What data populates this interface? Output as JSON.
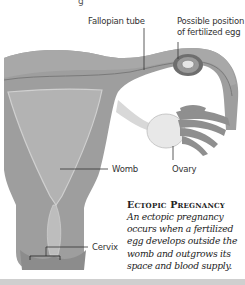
{
  "diagram": {
    "title_fragment": "g",
    "labels": {
      "fallopian_tube": "Fallopian tube",
      "possible_position_line1": "Possible position",
      "possible_position_line2": "of fertilized egg",
      "womb": "Womb",
      "ovary": "Ovary",
      "cervix": "Cervix"
    },
    "caption": {
      "title": "Ectopic Pregnancy",
      "body": "An ectopic pregnancy occurs when a fertilized egg develops outside the womb and outgrows its space and blood supply."
    },
    "colors": {
      "tissue": "#9a9a9a",
      "tissue_light": "#b8b8b8",
      "cavity": "#c4c4c4",
      "ovary": "#e6e6e6",
      "bottom_bar": "#cfcfcf"
    }
  }
}
